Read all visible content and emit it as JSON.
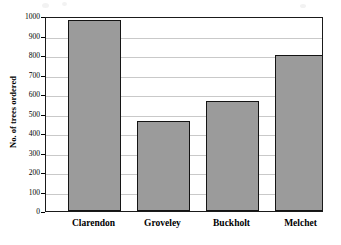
{
  "chart_data": {
    "type": "bar",
    "title": "",
    "subtitle": "",
    "xlabel": "",
    "ylabel": "No. of trees ordered",
    "categories": [
      "Clarendon",
      "Groveley",
      "Buckholt",
      "Melchet"
    ],
    "values": [
      990,
      465,
      568,
      807
    ],
    "series": [
      {
        "name": "No. of trees ordered",
        "values": [
          990,
          465,
          568,
          807
        ]
      }
    ],
    "ylim": [
      0,
      1000
    ],
    "yticks": [
      0,
      100,
      200,
      300,
      400,
      500,
      600,
      700,
      800,
      900,
      1000
    ],
    "ytick_labels": [
      "0",
      "100",
      "200",
      "300",
      "400",
      "500",
      "600",
      "700",
      "800",
      "900",
      "1000"
    ],
    "grid": "horizontal",
    "legend": "none",
    "bar_color": "#9b9b9b",
    "bar_border_color": "#141414",
    "gridline_color": "#c9c9c9",
    "axis_color": "#1a1a1a",
    "background_color": "#ffffff",
    "annotations": []
  }
}
